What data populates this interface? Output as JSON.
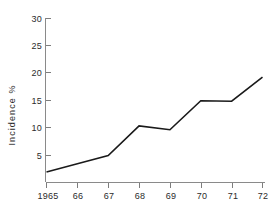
{
  "chart_data": {
    "type": "line",
    "title": "",
    "xlabel": "",
    "ylabel": "Incidence %",
    "x": [
      1965,
      1966,
      1967,
      1968,
      1969,
      1970,
      1971,
      1972
    ],
    "x_tick_labels": [
      "1965",
      "66",
      "67",
      "68",
      "69",
      "70",
      "71",
      "72"
    ],
    "values": [
      2.0,
      3.5,
      5.0,
      10.4,
      9.7,
      15.0,
      14.9,
      19.3
    ],
    "series": [
      {
        "name": "Incidence %",
        "values": [
          2.0,
          3.5,
          5.0,
          10.4,
          9.7,
          15.0,
          14.9,
          19.3
        ]
      }
    ],
    "y_tick_labels": [
      "5",
      "10",
      "15",
      "20",
      "25",
      "30"
    ],
    "y_ticks": [
      5,
      10,
      15,
      20,
      25,
      30
    ],
    "ylim": [
      0,
      30
    ],
    "xlim": [
      1965,
      1972
    ],
    "grid": false,
    "legend": false,
    "line_color": "#1a1a1a",
    "axis_color": "#8a8a8a",
    "background_color": "#ffffff"
  },
  "axes": {
    "y_title": "Incidence %"
  }
}
